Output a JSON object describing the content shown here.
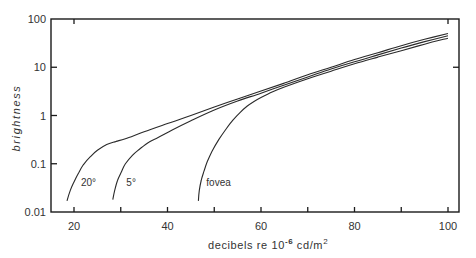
{
  "chart_data": {
    "type": "line",
    "title": "",
    "xlabel": "decibels re 10^-6 cd/m^2",
    "xlabel_parts": {
      "main": "decibels re 10",
      "exp": "-6",
      "unit": " cd/m",
      "unit_exp": "2"
    },
    "ylabel": "brightness",
    "xlim": [
      15,
      102.5
    ],
    "ylim": [
      0.01,
      100
    ],
    "yscale": "log",
    "grid": false,
    "legend": "inline labels near curves",
    "x_ticks": [
      20,
      30,
      40,
      50,
      60,
      70,
      80,
      90,
      100
    ],
    "x_tick_labels": [
      {
        "value": 20,
        "label": "20"
      },
      {
        "value": 40,
        "label": "40"
      },
      {
        "value": 60,
        "label": "60"
      },
      {
        "value": 80,
        "label": "80"
      },
      {
        "value": 100,
        "label": "100"
      }
    ],
    "y_ticks": [
      {
        "value": 100,
        "label": "100"
      },
      {
        "value": 10,
        "label": "10"
      },
      {
        "value": 1,
        "label": "1"
      },
      {
        "value": 0.1,
        "label": "0.1"
      },
      {
        "value": 0.01,
        "label": "0.01"
      }
    ],
    "series": [
      {
        "name": "20°",
        "label_pos": {
          "x": 21.5,
          "y": 0.035
        },
        "points": [
          [
            18.5,
            0.017
          ],
          [
            19.2,
            0.028
          ],
          [
            20,
            0.042
          ],
          [
            21,
            0.065
          ],
          [
            22,
            0.095
          ],
          [
            23.5,
            0.14
          ],
          [
            25,
            0.19
          ],
          [
            27,
            0.25
          ],
          [
            29,
            0.29
          ],
          [
            31,
            0.33
          ],
          [
            35,
            0.46
          ],
          [
            40,
            0.68
          ],
          [
            45,
            1.0
          ],
          [
            50,
            1.5
          ],
          [
            55,
            2.2
          ],
          [
            60,
            3.2
          ],
          [
            65,
            4.7
          ],
          [
            70,
            7.0
          ],
          [
            75,
            10
          ],
          [
            80,
            14.5
          ],
          [
            85,
            20
          ],
          [
            90,
            28
          ],
          [
            95,
            38
          ],
          [
            100,
            50
          ]
        ]
      },
      {
        "name": "5°",
        "label_pos": {
          "x": 31.2,
          "y": 0.035
        },
        "points": [
          [
            28.3,
            0.018
          ],
          [
            28.7,
            0.028
          ],
          [
            29.3,
            0.045
          ],
          [
            30.2,
            0.07
          ],
          [
            31,
            0.1
          ],
          [
            32.5,
            0.15
          ],
          [
            34,
            0.2
          ],
          [
            36,
            0.28
          ],
          [
            38,
            0.35
          ],
          [
            41,
            0.5
          ],
          [
            45,
            0.78
          ],
          [
            50,
            1.3
          ],
          [
            55,
            2.0
          ],
          [
            60,
            2.9
          ],
          [
            65,
            4.3
          ],
          [
            70,
            6.3
          ],
          [
            75,
            9.2
          ],
          [
            80,
            13
          ],
          [
            85,
            18
          ],
          [
            90,
            25
          ],
          [
            95,
            34
          ],
          [
            100,
            45
          ]
        ]
      },
      {
        "name": "fovea",
        "label_pos": {
          "x": 48.3,
          "y": 0.035
        },
        "points": [
          [
            46.6,
            0.017
          ],
          [
            46.8,
            0.028
          ],
          [
            47.2,
            0.045
          ],
          [
            47.8,
            0.07
          ],
          [
            48.5,
            0.11
          ],
          [
            49.5,
            0.18
          ],
          [
            51,
            0.32
          ],
          [
            52.5,
            0.52
          ],
          [
            54,
            0.8
          ],
          [
            55.5,
            1.15
          ],
          [
            57,
            1.55
          ],
          [
            58.5,
            1.95
          ],
          [
            60,
            2.35
          ],
          [
            62.5,
            3.1
          ],
          [
            65,
            3.9
          ],
          [
            70,
            5.8
          ],
          [
            75,
            8.3
          ],
          [
            80,
            11.8
          ],
          [
            85,
            16.2
          ],
          [
            90,
            22
          ],
          [
            95,
            30
          ],
          [
            100,
            40
          ]
        ]
      }
    ]
  },
  "colors": {
    "axis": "#1a1a1a",
    "curve": "#2a2a2a",
    "text": "#333333",
    "background": "#ffffff"
  }
}
